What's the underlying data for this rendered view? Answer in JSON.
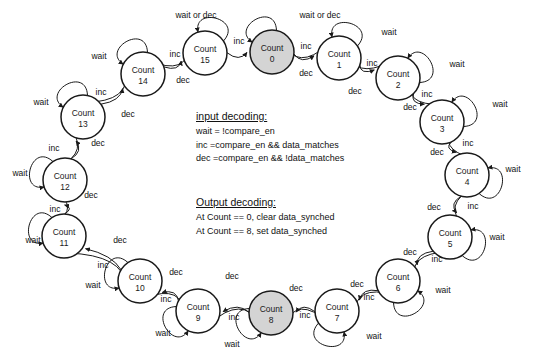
{
  "diagram": {
    "state_label_prefix": "Count",
    "radius": 22,
    "shaded_color": "#d4d4d4",
    "stroke_color": "#1a1a1a",
    "states": [
      {
        "id": 0,
        "name": "Count",
        "number": "0",
        "cx": 272,
        "cy": 52,
        "shaded": true,
        "self_loop": "wait or dec",
        "loop_dir": "up-left",
        "loop_label_x": 320,
        "loop_label_y": 18
      },
      {
        "id": 1,
        "name": "Count",
        "number": "1",
        "cx": 339,
        "cy": 58,
        "shaded": false,
        "self_loop": "wait",
        "loop_dir": "up",
        "loop_label_x": 389,
        "loop_label_y": 35
      },
      {
        "id": 2,
        "name": "Count",
        "number": "2",
        "cx": 398,
        "cy": 78,
        "shaded": false,
        "self_loop": "wait",
        "loop_dir": "up-right",
        "loop_label_x": 457,
        "loop_label_y": 67
      },
      {
        "id": 3,
        "name": "Count",
        "number": "3",
        "cx": 442,
        "cy": 122,
        "shaded": false,
        "self_loop": "wait",
        "loop_dir": "up-right",
        "loop_label_x": 500,
        "loop_label_y": 107
      },
      {
        "id": 4,
        "name": "Count",
        "number": "4",
        "cx": 467,
        "cy": 175,
        "shaded": false,
        "self_loop": "wait",
        "loop_dir": "right",
        "loop_label_x": 513,
        "loop_label_y": 172
      },
      {
        "id": 5,
        "name": "Count",
        "number": "5",
        "cx": 450,
        "cy": 237,
        "shaded": false,
        "self_loop": "wait",
        "loop_dir": "right",
        "loop_label_x": 497,
        "loop_label_y": 240
      },
      {
        "id": 6,
        "name": "Count",
        "number": "6",
        "cx": 398,
        "cy": 281,
        "shaded": false,
        "self_loop": "wait",
        "loop_dir": "down-right",
        "loop_label_x": 443,
        "loop_label_y": 293
      },
      {
        "id": 7,
        "name": "Count",
        "number": "7",
        "cx": 337,
        "cy": 311,
        "shaded": false,
        "self_loop": "wait",
        "loop_dir": "down",
        "loop_label_x": 374,
        "loop_label_y": 339
      },
      {
        "id": 8,
        "name": "Count",
        "number": "8",
        "cx": 271,
        "cy": 313,
        "shaded": true,
        "self_loop": "wait",
        "loop_dir": "down-left",
        "loop_label_x": 232,
        "loop_label_y": 347
      },
      {
        "id": 9,
        "name": "Count",
        "number": "9",
        "cx": 198,
        "cy": 311,
        "shaded": false,
        "self_loop": "wait",
        "loop_dir": "down-left",
        "loop_label_x": 163,
        "loop_label_y": 336
      },
      {
        "id": 10,
        "name": "Count",
        "number": "10",
        "cx": 140,
        "cy": 281,
        "shaded": false,
        "self_loop": "wait",
        "loop_dir": "left",
        "loop_label_x": 93,
        "loop_label_y": 288
      },
      {
        "id": 11,
        "name": "Count",
        "number": "11",
        "cx": 64,
        "cy": 236,
        "shaded": false,
        "self_loop": "wait",
        "loop_dir": "left",
        "loop_label_x": 33,
        "loop_label_y": 243
      },
      {
        "id": 12,
        "name": "Count",
        "number": "12",
        "cx": 65,
        "cy": 180,
        "shaded": false,
        "self_loop": "wait",
        "loop_dir": "left",
        "loop_label_x": 20,
        "loop_label_y": 176
      },
      {
        "id": 13,
        "name": "Count",
        "number": "13",
        "cx": 83,
        "cy": 117,
        "shaded": false,
        "self_loop": "wait",
        "loop_dir": "up-left",
        "loop_label_x": 41,
        "loop_label_y": 105
      },
      {
        "id": 14,
        "name": "Count",
        "number": "14",
        "cx": 143,
        "cy": 74,
        "shaded": false,
        "self_loop": "wait",
        "loop_dir": "up-left",
        "loop_label_x": 99,
        "loop_label_y": 59
      },
      {
        "id": 15,
        "name": "Count",
        "number": "15",
        "cx": 205,
        "cy": 53,
        "shaded": false,
        "self_loop": "wait or dec",
        "loop_dir": "up",
        "loop_label_x": 196,
        "loop_label_y": 18
      }
    ],
    "inc_label": "inc",
    "dec_label": "dec",
    "inc_edges": [
      {
        "from": 0,
        "to": 1,
        "label": "inc",
        "lx": 306,
        "ly": 49
      },
      {
        "from": 1,
        "to": 2,
        "label": "inc",
        "lx": 372,
        "ly": 66
      },
      {
        "from": 2,
        "to": 3,
        "label": "inc",
        "lx": 427,
        "ly": 97
      },
      {
        "from": 3,
        "to": 4,
        "label": "inc",
        "lx": 468,
        "ly": 146
      },
      {
        "from": 4,
        "to": 5,
        "label": "inc",
        "lx": 473,
        "ly": 209
      },
      {
        "from": 5,
        "to": 6,
        "label": "inc",
        "lx": 437,
        "ly": 262
      },
      {
        "from": 6,
        "to": 7,
        "label": "inc",
        "lx": 369,
        "ly": 300
      },
      {
        "from": 7,
        "to": 8,
        "label": "inc",
        "lx": 305,
        "ly": 318
      },
      {
        "from": 8,
        "to": 9,
        "label": "inc",
        "lx": 234,
        "ly": 320
      },
      {
        "from": 9,
        "to": 10,
        "label": "inc",
        "lx": 166,
        "ly": 302
      },
      {
        "from": 10,
        "to": 11,
        "label": "inc",
        "lx": 103,
        "ly": 268
      },
      {
        "from": 11,
        "to": 12,
        "label": "inc",
        "lx": 55,
        "ly": 212
      },
      {
        "from": 12,
        "to": 13,
        "label": "inc",
        "lx": 54,
        "ly": 151
      },
      {
        "from": 13,
        "to": 14,
        "label": "inc",
        "lx": 101,
        "ly": 95
      },
      {
        "from": 14,
        "to": 15,
        "label": "inc",
        "lx": 175,
        "ly": 57
      },
      {
        "from": 15,
        "to": 0,
        "label": "inc",
        "lx": 239,
        "ly": 44
      }
    ],
    "dec_edges": [
      {
        "from": 1,
        "to": 0,
        "label": "dec",
        "lx": 306,
        "ly": 76
      },
      {
        "from": 2,
        "to": 1,
        "label": "dec",
        "lx": 355,
        "ly": 94
      },
      {
        "from": 3,
        "to": 2,
        "label": "dec",
        "lx": 410,
        "ly": 110
      },
      {
        "from": 4,
        "to": 3,
        "label": "dec",
        "lx": 437,
        "ly": 155
      },
      {
        "from": 5,
        "to": 4,
        "label": "dec",
        "lx": 434,
        "ly": 210
      },
      {
        "from": 6,
        "to": 5,
        "label": "dec",
        "lx": 410,
        "ly": 255
      },
      {
        "from": 7,
        "to": 6,
        "label": "dec",
        "lx": 357,
        "ly": 287
      },
      {
        "from": 8,
        "to": 7,
        "label": "dec",
        "lx": 296,
        "ly": 291
      },
      {
        "from": 9,
        "to": 8,
        "label": "dec",
        "lx": 232,
        "ly": 279
      },
      {
        "from": 10,
        "to": 9,
        "label": "dec",
        "lx": 176,
        "ly": 275
      },
      {
        "from": 11,
        "to": 10,
        "label": "dec",
        "lx": 120,
        "ly": 243
      },
      {
        "from": 12,
        "to": 11,
        "label": "dec",
        "lx": 91,
        "ly": 198
      },
      {
        "from": 13,
        "to": 12,
        "label": "dec",
        "lx": 98,
        "ly": 146
      },
      {
        "from": 14,
        "to": 13,
        "label": "dec",
        "lx": 128,
        "ly": 117
      },
      {
        "from": 15,
        "to": 14,
        "label": "dec",
        "lx": 183,
        "ly": 83
      }
    ]
  },
  "input_decoding": {
    "title": "input decoding:",
    "lines": [
      "wait = !compare_en",
      "inc =compare_en && data_matches",
      "dec =compare_en && !data_matches"
    ]
  },
  "output_decoding": {
    "title": "Output decoding:",
    "lines": [
      "At Count == 0, clear data_synched",
      "At Count == 8, set data_synched"
    ]
  }
}
